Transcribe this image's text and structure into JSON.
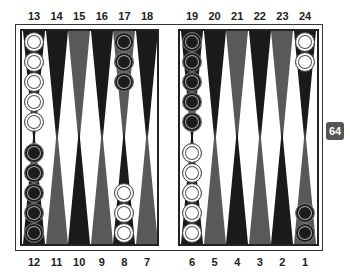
{
  "board": {
    "colors": {
      "dark_point": "#1a1a1a",
      "gray_point": "#595959",
      "white_checker": "#ffffff",
      "black_checker": "#1c1c1c",
      "cube": "#555555"
    },
    "top_labels": [
      "13",
      "14",
      "15",
      "16",
      "17",
      "18",
      "19",
      "20",
      "21",
      "22",
      "23",
      "24"
    ],
    "bottom_labels": [
      "12",
      "11",
      "10",
      "9",
      "8",
      "7",
      "6",
      "5",
      "4",
      "3",
      "2",
      "1"
    ],
    "points": {
      "13": {
        "color": "dark",
        "checkers": {
          "white": 5
        }
      },
      "14": {
        "color": "dark",
        "checkers": {}
      },
      "15": {
        "color": "gray",
        "checkers": {}
      },
      "16": {
        "color": "dark",
        "checkers": {}
      },
      "17": {
        "color": "gray",
        "checkers": {
          "black": 3
        }
      },
      "18": {
        "color": "dark",
        "checkers": {}
      },
      "19": {
        "color": "dark",
        "checkers": {
          "black": 5
        }
      },
      "20": {
        "color": "dark",
        "checkers": {}
      },
      "21": {
        "color": "gray",
        "checkers": {}
      },
      "22": {
        "color": "dark",
        "checkers": {}
      },
      "23": {
        "color": "gray",
        "checkers": {}
      },
      "24": {
        "color": "dark",
        "checkers": {
          "white": 2
        }
      },
      "12": {
        "color": "dark",
        "checkers": {
          "black": 5
        }
      },
      "11": {
        "color": "gray",
        "checkers": {}
      },
      "10": {
        "color": "dark",
        "checkers": {}
      },
      "9": {
        "color": "gray",
        "checkers": {}
      },
      "8": {
        "color": "dark",
        "checkers": {
          "white": 3
        }
      },
      "7": {
        "color": "gray",
        "checkers": {}
      },
      "6": {
        "color": "dark",
        "checkers": {
          "white": 5
        }
      },
      "5": {
        "color": "gray",
        "checkers": {}
      },
      "4": {
        "color": "dark",
        "checkers": {}
      },
      "3": {
        "color": "gray",
        "checkers": {}
      },
      "2": {
        "color": "dark",
        "checkers": {}
      },
      "1": {
        "color": "gray",
        "checkers": {
          "black": 2
        }
      }
    }
  },
  "doubling_cube": {
    "value": "64"
  }
}
